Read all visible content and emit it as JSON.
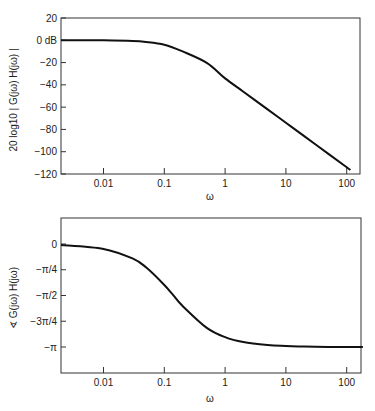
{
  "chart_data": [
    {
      "type": "line",
      "title": "",
      "xlabel": "ω",
      "ylabel": "20 log10 | G(jω) H(jω) |",
      "xscale": "log",
      "xlim": [
        0.002,
        140
      ],
      "ylim": [
        -120,
        20
      ],
      "grid": false,
      "x_ticks": [
        {
          "value": 0.01,
          "label": "0.01"
        },
        {
          "value": 0.1,
          "label": "0.1"
        },
        {
          "value": 1,
          "label": "1"
        },
        {
          "value": 10,
          "label": "10"
        },
        {
          "value": 100,
          "label": "100"
        }
      ],
      "y_ticks": [
        {
          "value": 20,
          "label": "20"
        },
        {
          "value": 0,
          "label": "0 dB"
        },
        {
          "value": -20,
          "label": "−20"
        },
        {
          "value": -40,
          "label": "−40"
        },
        {
          "value": -60,
          "label": "−60"
        },
        {
          "value": -80,
          "label": "−80"
        },
        {
          "value": -100,
          "label": "−100"
        },
        {
          "value": -120,
          "label": "−120"
        }
      ],
      "series": [
        {
          "name": "magnitude",
          "x": [
            0.002,
            0.01,
            0.03,
            0.05,
            0.1,
            0.2,
            0.5,
            1,
            2,
            5,
            10,
            20,
            50,
            100,
            115
          ],
          "y": [
            0.0,
            -0.05,
            -0.6,
            -1.5,
            -4.0,
            -10.0,
            -20.3,
            -34.2,
            -46.1,
            -62.0,
            -74.0,
            -86.0,
            -102.0,
            -114.0,
            -116.4
          ]
        }
      ]
    },
    {
      "type": "line",
      "title": "",
      "xlabel": "ω",
      "ylabel": "∢ G(jω) H(jω)",
      "xscale": "log",
      "xlim": [
        0.002,
        185
      ],
      "ylim": [
        -3.8,
        0.6
      ],
      "grid": false,
      "x_ticks": [
        {
          "value": 0.01,
          "label": "0.01"
        },
        {
          "value": 0.1,
          "label": "0.1"
        },
        {
          "value": 1,
          "label": "1"
        },
        {
          "value": 10,
          "label": "10"
        },
        {
          "value": 100,
          "label": "100"
        }
      ],
      "y_ticks": [
        {
          "value": 0,
          "label": "0"
        },
        {
          "value": -0.785,
          "label": "−π/4"
        },
        {
          "value": -1.571,
          "label": "−π/2"
        },
        {
          "value": -2.356,
          "label": "−3π/4"
        },
        {
          "value": -3.1416,
          "label": "−π"
        }
      ],
      "series": [
        {
          "name": "phase",
          "x": [
            0.002,
            0.01,
            0.03,
            0.05,
            0.1,
            0.14,
            0.2,
            0.5,
            1,
            2,
            5,
            10,
            20,
            50,
            100,
            185
          ],
          "y": [
            -0.03,
            -0.15,
            -0.44,
            -0.71,
            -1.25,
            -1.56,
            -1.89,
            -2.56,
            -2.84,
            -2.99,
            -3.08,
            -3.11,
            -3.13,
            -3.14,
            -3.14,
            -3.14
          ]
        }
      ]
    }
  ]
}
